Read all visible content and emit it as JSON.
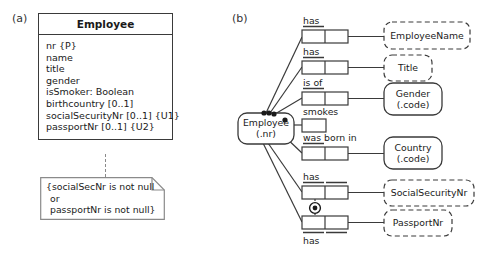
{
  "figure": {
    "panel_a_label": "(a)",
    "panel_b_label": "(b)"
  },
  "uml": {
    "class_name": "Employee",
    "attributes": [
      "nr {P}",
      "name",
      "title",
      "gender",
      "isSmoker: Boolean",
      "birthcountry [0..1]",
      "socialSecurityNr [0..1] {U1}",
      "passportNr [0..1] {U2}"
    ],
    "note": [
      "{socialSecNr is not null",
      "or",
      "passportNr is not null}"
    ]
  },
  "orm": {
    "entity_employee": {
      "name": "Employee",
      "refmode": "(.nr)"
    },
    "objects": [
      {
        "name": "EmployeeName",
        "refmode": "",
        "kind": "value"
      },
      {
        "name": "Title",
        "refmode": "",
        "kind": "value"
      },
      {
        "name": "Gender",
        "refmode": "(.code)",
        "kind": "entity"
      },
      {
        "name": "Country",
        "refmode": "(.code)",
        "kind": "entity"
      },
      {
        "name": "SocialSecurityNr",
        "refmode": "",
        "kind": "value"
      },
      {
        "name": "PassportNr",
        "refmode": "",
        "kind": "value"
      }
    ],
    "predicates": [
      {
        "label": "has",
        "arity": 2,
        "uniqueness": "left"
      },
      {
        "label": "has",
        "arity": 2,
        "uniqueness": "left"
      },
      {
        "label": "is of",
        "arity": 2,
        "uniqueness": "left"
      },
      {
        "label": "smokes",
        "arity": 1,
        "uniqueness": "none"
      },
      {
        "label": "was born in",
        "arity": 2,
        "uniqueness": "left"
      },
      {
        "label": "has",
        "arity": 2,
        "uniqueness": "both"
      },
      {
        "label": "has",
        "arity": 2,
        "uniqueness": "both"
      }
    ],
    "constraint": {
      "name": "inclusive-or-constraint",
      "symbol": "circled-dot"
    }
  },
  "colors": {
    "line": "#3a3a3a",
    "text": "#1a1a1a",
    "dashed": "#8a8a8a",
    "background": "#ffffff"
  }
}
